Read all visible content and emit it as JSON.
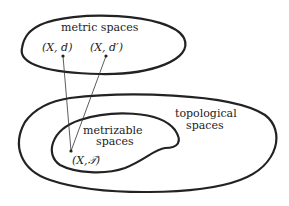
{
  "diagram": {
    "regions": {
      "metric": {
        "label": "metric spaces"
      },
      "topological": {
        "label_line1": "topological",
        "label_line2": "spaces"
      },
      "metrizable": {
        "label_line1": "metrizable",
        "label_line2": "spaces"
      }
    },
    "points": {
      "metric1": {
        "label": "(X, d)"
      },
      "metric2": {
        "label": "(X, d′)"
      },
      "topo": {
        "label": "(X,\u0001D4AF)"
      }
    },
    "colors": {
      "stroke": "#222222",
      "background": "#ffffff"
    }
  }
}
